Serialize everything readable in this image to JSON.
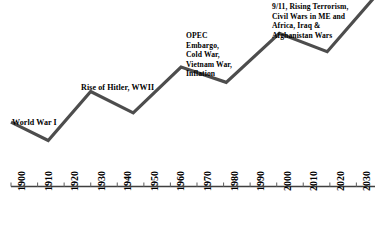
{
  "chart_data": {
    "type": "line",
    "title": "",
    "xlabel": "",
    "ylabel": "",
    "grid": false,
    "legend": "none",
    "xlim": [
      1900,
      2037
    ],
    "ylim": [
      0,
      100
    ],
    "xticks": [
      "1900",
      "1910",
      "1920",
      "1930",
      "1940",
      "1950",
      "1960",
      "1970",
      "1980",
      "1990",
      "2000",
      "2010",
      "2020",
      "2030"
    ],
    "xtick_interval": 10,
    "minor_tick_interval": 5,
    "yticks": [],
    "series": [
      {
        "name": "Trend",
        "color": "#4d4d4d",
        "x": [
          1900,
          1914,
          1930,
          1946,
          1964,
          1981,
          2001,
          2019,
          2037
        ],
        "y": [
          30,
          18,
          50,
          36,
          66,
          56,
          88,
          76,
          112
        ]
      }
    ],
    "annotations": [
      {
        "id": "world-war-i",
        "text": "World War I",
        "x": 1905,
        "y": 41,
        "lines": [
          "World War I"
        ]
      },
      {
        "id": "rise-of-hitler-wwii",
        "text": "Rise of Hitler, WWII",
        "x": 1928,
        "y": 67,
        "lines": [
          "Rise of Hitler, WWII"
        ]
      },
      {
        "id": "opec-cold-war",
        "text": "OPEC\nEmbargo,\nCold War,\nVietnam War,\nInflation",
        "x": 1966,
        "y": 86,
        "lines": [
          "OPEC",
          "Embargo,",
          "Cold War,",
          "Vietnam War,",
          "Inflation"
        ]
      },
      {
        "id": "nine-eleven-terrorism",
        "text": "9/11, Rising Terrorism,\nCivil Wars in ME and\nAfrica, Iraq &\nAfghanistan Wars",
        "x": 2000,
        "y": 99,
        "lines": [
          "9/11, Rising Terrorism,",
          "Civil Wars in ME and",
          "Africa, Iraq &",
          "Afghanistan Wars"
        ]
      }
    ]
  },
  "axis": {
    "line_color": "#3f3f3f",
    "tick_color": "#6b6b6b",
    "labels": [
      "1900",
      "1910",
      "1920",
      "1930",
      "1940",
      "1950",
      "1960",
      "1970",
      "1980",
      "1990",
      "2000",
      "2010",
      "2020",
      "2030"
    ]
  },
  "annotations": {
    "world_war_i": "World War I",
    "rise_of_hitler": "Rise of Hitler, WWII",
    "opec": "OPEC\nEmbargo,\nCold War,\nVietnam War,\nInflation",
    "nine_eleven": "9/11, Rising Terrorism,\nCivil Wars in ME and\nAfrica, Iraq &\nAfghanistan Wars"
  },
  "colors": {
    "line": "#4d4d4d",
    "axis": "#3f3f3f",
    "text": "#000000",
    "background": "#ffffff"
  }
}
